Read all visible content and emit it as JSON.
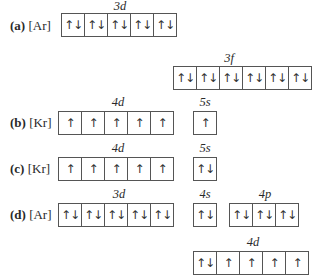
{
  "configs": {
    "a": {
      "letter": "(a)",
      "core": "[Ar]",
      "subshells": [
        {
          "label": "3d",
          "electrons": [
            "↑↓",
            "↑↓",
            "↑↓",
            "↑↓",
            "↑↓"
          ]
        },
        {
          "label": "3f",
          "electrons": [
            "↑↓",
            "↑↓",
            "↑↓",
            "↑↓",
            "↑↓",
            "↑↓",
            "↑↓"
          ]
        }
      ]
    },
    "b": {
      "letter": "(b)",
      "core": "[Kr]",
      "subshells": [
        {
          "label": "4d",
          "electrons": [
            "↑",
            "↑",
            "↑",
            "↑",
            "↑"
          ]
        },
        {
          "label": "5s",
          "electrons": [
            "↑"
          ]
        }
      ]
    },
    "c": {
      "letter": "(c)",
      "core": "[Kr]",
      "subshells": [
        {
          "label": "4d",
          "electrons": [
            "↑",
            "↑",
            "↑",
            "↑",
            "↑"
          ]
        },
        {
          "label": "5s",
          "electrons": [
            "↑↓"
          ]
        }
      ]
    },
    "d": {
      "letter": "(d)",
      "core": "[Ar]",
      "subshells": [
        {
          "label": "3d",
          "electrons": [
            "↑↓",
            "↑↓",
            "↑↓",
            "↑↓",
            "↑↓"
          ]
        },
        {
          "label": "4s",
          "electrons": [
            "↑↓"
          ]
        },
        {
          "label": "4p",
          "electrons": [
            "↑↓",
            "↑↓",
            "↑↓"
          ]
        },
        {
          "label": "4d",
          "electrons": [
            "↑↓",
            "↑",
            "↑",
            "↑",
            "↑"
          ]
        }
      ]
    }
  }
}
